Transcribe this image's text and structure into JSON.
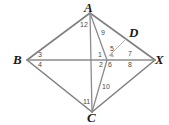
{
  "figure": {
    "shape_name": "quadrilateral-BACX",
    "colors": {
      "stroke": "#808080",
      "stroke_light": "#a9a9a9",
      "vertex_text": "#1a1a1a",
      "angle_text": "#4a4a4a",
      "background": "#ffffff"
    },
    "vertices": [
      {
        "id": "A",
        "label": "A",
        "x": 90,
        "y": 13,
        "label_x": 84,
        "label_y": 1
      },
      {
        "id": "B",
        "label": "B",
        "x": 27,
        "y": 60,
        "label_x": 13,
        "label_y": 53
      },
      {
        "id": "C",
        "label": "C",
        "x": 92,
        "y": 112,
        "label_x": 87,
        "label_y": 111
      },
      {
        "id": "X",
        "label": "X",
        "x": 155,
        "y": 60,
        "label_x": 155,
        "label_y": 53
      },
      {
        "id": "D",
        "label": "D",
        "x": 127,
        "y": 38,
        "label_x": 129,
        "label_y": 26
      }
    ],
    "segments": [
      {
        "id": "B-A",
        "from": "B",
        "to": "A"
      },
      {
        "id": "B-C",
        "from": "B",
        "to": "C"
      },
      {
        "id": "B-X",
        "from": "B",
        "to": "X"
      },
      {
        "id": "A-X",
        "from": "A",
        "to": "X"
      },
      {
        "id": "C-X",
        "from": "C",
        "to": "X"
      },
      {
        "id": "A-C",
        "from": "A",
        "to": "C"
      },
      {
        "id": "D-P",
        "from": "D",
        "to": "P",
        "style": "light"
      }
    ],
    "intersection": {
      "id": "P",
      "x": 107,
      "y": 60
    },
    "angle_labels": [
      {
        "n": "1",
        "x": 98,
        "y": 51
      },
      {
        "n": "2",
        "x": 99,
        "y": 61
      },
      {
        "n": "3",
        "x": 38,
        "y": 51
      },
      {
        "n": "4",
        "x": 38,
        "y": 61
      },
      {
        "n": "5",
        "x": 110,
        "y": 45
      },
      {
        "n": "6",
        "x": 108,
        "y": 61
      },
      {
        "n": "7",
        "x": 128,
        "y": 50
      },
      {
        "n": "8",
        "x": 128,
        "y": 61
      },
      {
        "n": "9",
        "x": 101,
        "y": 29
      },
      {
        "n": "10",
        "x": 102,
        "y": 83
      },
      {
        "n": "11",
        "x": 83,
        "y": 98
      },
      {
        "n": "12",
        "x": 80,
        "y": 21
      }
    ]
  }
}
